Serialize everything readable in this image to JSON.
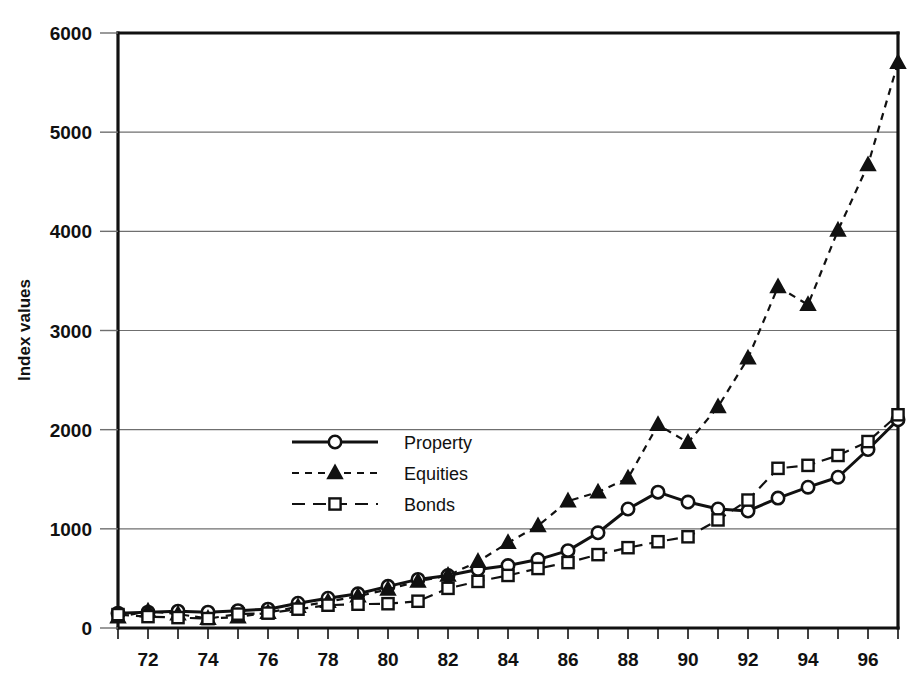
{
  "chart_data": {
    "type": "line",
    "title": "",
    "xlabel": "",
    "ylabel": "Index values",
    "xlim": [
      71,
      97
    ],
    "ylim": [
      0,
      6000
    ],
    "grid": true,
    "grid_axis": "y",
    "legend_position": "center-left-inside",
    "yticks": [
      0,
      1000,
      2000,
      3000,
      4000,
      5000,
      6000
    ],
    "ytick_labels": [
      "0",
      "1000",
      "2000",
      "3000",
      "4000",
      "5000",
      "6000"
    ],
    "xticks": [
      72,
      74,
      76,
      78,
      80,
      82,
      84,
      86,
      88,
      90,
      92,
      94,
      96
    ],
    "xtick_labels": [
      "72",
      "74",
      "76",
      "78",
      "80",
      "82",
      "84",
      "86",
      "88",
      "90",
      "92",
      "94",
      "96"
    ],
    "x": [
      71,
      72,
      73,
      74,
      75,
      76,
      77,
      78,
      79,
      80,
      81,
      82,
      83,
      84,
      85,
      86,
      87,
      88,
      89,
      90,
      91,
      92,
      93,
      94,
      95,
      96,
      97
    ],
    "series": [
      {
        "name": "Property",
        "marker": "circle",
        "linestyle": "solid",
        "color": "#111111",
        "values": [
          150,
          160,
          170,
          160,
          175,
          190,
          250,
          300,
          345,
          420,
          490,
          530,
          590,
          630,
          690,
          780,
          960,
          1200,
          1370,
          1270,
          1200,
          1180,
          1310,
          1420,
          1520,
          1800,
          2100
        ]
      },
      {
        "name": "Equities",
        "marker": "triangle",
        "linestyle": "dashed",
        "color": "#111111",
        "values": [
          110,
          170,
          140,
          95,
          110,
          155,
          215,
          265,
          320,
          390,
          470,
          530,
          670,
          860,
          1030,
          1280,
          1370,
          1510,
          2050,
          1870,
          2230,
          2720,
          3440,
          3260,
          4010,
          4670,
          5700
        ]
      },
      {
        "name": "Bonds",
        "marker": "square",
        "linestyle": "dashed",
        "color": "#111111",
        "values": [
          135,
          115,
          105,
          95,
          140,
          150,
          190,
          230,
          240,
          245,
          270,
          400,
          470,
          530,
          600,
          660,
          740,
          810,
          870,
          920,
          1090,
          1290,
          1610,
          1640,
          1740,
          1880,
          2150
        ]
      }
    ]
  },
  "legend": {
    "items": [
      {
        "label": "Property",
        "marker": "circle",
        "linestyle": "solid"
      },
      {
        "label": "Equities",
        "marker": "triangle",
        "linestyle": "dashed"
      },
      {
        "label": "Bonds",
        "marker": "square",
        "linestyle": "dashed"
      }
    ]
  },
  "axes": {
    "y_title": "Index values"
  }
}
